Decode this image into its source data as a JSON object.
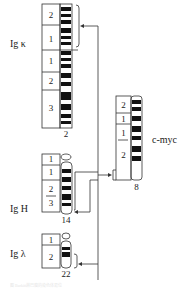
{
  "figure": {
    "chromosomes": [
      {
        "id": "chr2",
        "number": "2",
        "gene_label": "Ig κ",
        "arm_labels": [
          "2",
          "1",
          "1",
          "2",
          "3"
        ]
      },
      {
        "id": "chr14",
        "number": "14",
        "gene_label": "Ig H",
        "arm_labels": [
          "1",
          "1",
          "2",
          "3"
        ]
      },
      {
        "id": "chr22",
        "number": "22",
        "gene_label": "Ig λ",
        "arm_labels": [
          "1",
          "2"
        ]
      },
      {
        "id": "chr8",
        "number": "8",
        "gene_label": "c-myc",
        "arm_labels": [
          "2",
          "1",
          "1",
          "2"
        ]
      }
    ],
    "band_sublabels": {
      "chr22": [
        "1",
        "2",
        "3"
      ],
      "chr8": [
        "1",
        "2",
        "3",
        "4"
      ]
    },
    "caption": "图 Burkitt淋巴瘤的染色体易位",
    "colors": {
      "ink": "#1a1a1a",
      "band": "#111111",
      "line": "#333333"
    }
  }
}
